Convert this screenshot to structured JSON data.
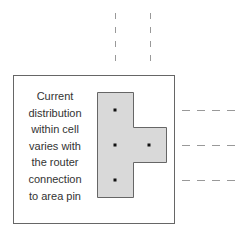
{
  "diagram": {
    "caption_lines": [
      "Current",
      "distribution",
      "within cell",
      "varies with",
      "the router",
      "connection",
      "to area pin"
    ],
    "colors": {
      "cell_border": "#666666",
      "pin_fill": "#d9d9d9",
      "pin_border": "#666666",
      "connection_point": "#111111",
      "router_wire": "#999999",
      "text": "#333333"
    },
    "cell": {
      "x": 13,
      "y": 75,
      "width": 161,
      "height": 148
    },
    "area_pin_shape": "T-shape",
    "connection_points": [
      {
        "x": 115,
        "y": 110
      },
      {
        "x": 115,
        "y": 145
      },
      {
        "x": 149,
        "y": 145
      },
      {
        "x": 115,
        "y": 180
      }
    ],
    "router_wires": {
      "vertical_x": [
        115,
        150
      ],
      "horizontal_y": [
        110,
        145,
        180
      ]
    }
  }
}
